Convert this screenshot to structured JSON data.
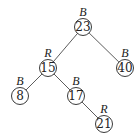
{
  "diagram": {
    "type": "red-black-tree",
    "nodes": [
      {
        "id": "n23",
        "key": "23",
        "color": "B",
        "x": 83,
        "y": 27
      },
      {
        "id": "n15",
        "key": "15",
        "color": "R",
        "x": 48,
        "y": 68
      },
      {
        "id": "n40",
        "key": "40",
        "color": "B",
        "x": 125,
        "y": 68
      },
      {
        "id": "n8",
        "key": "8",
        "color": "B",
        "x": 20,
        "y": 96
      },
      {
        "id": "n17",
        "key": "17",
        "color": "B",
        "x": 76,
        "y": 96
      },
      {
        "id": "n21",
        "key": "21",
        "color": "R",
        "x": 104,
        "y": 124
      }
    ],
    "edges": [
      {
        "from": "n23",
        "to": "n15"
      },
      {
        "from": "n23",
        "to": "n40"
      },
      {
        "from": "n15",
        "to": "n8"
      },
      {
        "from": "n15",
        "to": "n17"
      },
      {
        "from": "n17",
        "to": "n21"
      }
    ],
    "node_radius": 8.5
  }
}
